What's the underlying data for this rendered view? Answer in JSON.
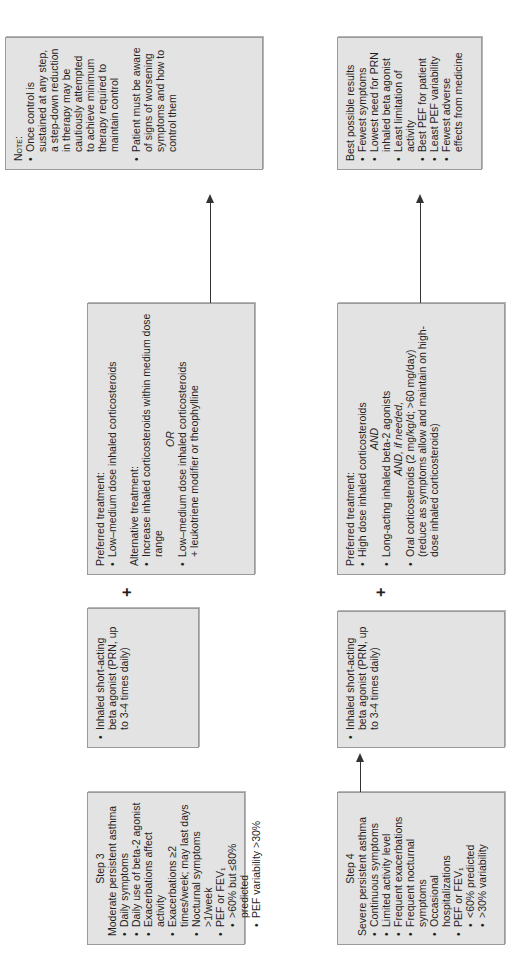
{
  "step3": {
    "title": "Step 3",
    "subtitle": "Moderate persistent asthma",
    "items": [
      "Daily symptoms",
      "Daily use of beta-2 agonist",
      "Exacerbations affect activity",
      "Exacerbations ≥2 times/week; may last days",
      "Nocturnal symptoms >1/week",
      "PEF or FEV₁"
    ],
    "subitems": [
      ">60% but ≤80% predicted",
      "PEF variability >30%"
    ]
  },
  "step3_reliever": {
    "text": "Inhaled short-acting beta agonist (PRN, up to 3-4 times daily)"
  },
  "step3_treatment": {
    "preferred_label": "Preferred treatment:",
    "preferred_items": [
      "Low–medium dose inhaled corticosteroids"
    ],
    "alternative_label": "Alternative treatment:",
    "alternative_item1": "Increase inhaled corticosteroids within medium dose range",
    "or_label": "OR",
    "alternative_item2_line1": "Low–medium dose inhaled corticosteroids",
    "alternative_item2_line2": "+ leukotriene modifier or theophylline"
  },
  "note": {
    "label": "Note:",
    "items": [
      "Once control is sustained at any step, a step-down reduction in therapy may be cautiously attempted to achieve minimum therapy required to maintain control",
      "Patient must be aware of signs of worsening symptoms and how to control them"
    ]
  },
  "step4": {
    "title": "Step 4",
    "subtitle": "Severe persistent asthma",
    "items": [
      "Continuous symptoms",
      "Limited activity level",
      "Frequent exacerbations",
      "Frequent nocturnal symptoms",
      "Occasional hospitalizations",
      "PEF or FEV₁"
    ],
    "subitems": [
      "<60% predicted",
      ">30% variability"
    ]
  },
  "step4_reliever": {
    "text": "Inhaled short-acting beta agonist (PRN, up to 3-4 times daily)"
  },
  "step4_treatment": {
    "preferred_label": "Preferred treatment:",
    "item1": "High dose inhaled corticosteroids",
    "and1": "AND",
    "item2": "Long-acting inhaled beta-2 agonists",
    "and2": "AND, if needed,",
    "item3": "Oral corticosteroids (2 mg/kg/d; >60 mg/day) (reduce as symptoms allow and maintain on high-dose inhaled corticosteroids)"
  },
  "results": {
    "title": "Best possible results",
    "items": [
      "Fewest symptoms",
      "Lowest need for PRN inhaled beta agonist",
      "Least limitation of activity",
      "Best PEF for patient",
      "Least PEF variability",
      "Fewest adverse effects from medicine"
    ]
  },
  "connectors": {
    "plus": "+"
  }
}
